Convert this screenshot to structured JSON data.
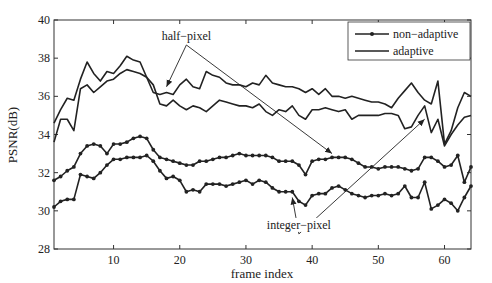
{
  "chart_data": {
    "type": "line",
    "title": "",
    "xlabel": "frame index",
    "ylabel": "PSNR(dB)",
    "xlim": [
      1,
      64
    ],
    "ylim": [
      28,
      40
    ],
    "xticks": [
      10,
      20,
      30,
      40,
      50,
      60
    ],
    "yticks": [
      28,
      30,
      32,
      34,
      36,
      38,
      40
    ],
    "grid": false,
    "legend": {
      "position": "upper right",
      "entries": [
        {
          "label": "non−adaptive",
          "style": "line-with-dots"
        },
        {
          "label": "adaptive",
          "style": "line"
        }
      ]
    },
    "annotations": [
      {
        "text": "half−pixel",
        "x": 21,
        "y": 38.9,
        "arrows_to": [
          [
            18,
            36.5
          ],
          [
            43,
            33.0
          ]
        ]
      },
      {
        "text": "integer−pixel",
        "x": 38,
        "y": 29.0,
        "arrows_to": [
          [
            37,
            30.7
          ],
          [
            57,
            34.8
          ]
        ]
      }
    ],
    "x": [
      1,
      2,
      3,
      4,
      5,
      6,
      7,
      8,
      9,
      10,
      11,
      12,
      13,
      14,
      15,
      16,
      17,
      18,
      19,
      20,
      21,
      22,
      23,
      24,
      25,
      26,
      27,
      28,
      29,
      30,
      31,
      32,
      33,
      34,
      35,
      36,
      37,
      38,
      39,
      40,
      41,
      42,
      43,
      44,
      45,
      46,
      47,
      48,
      49,
      50,
      51,
      52,
      53,
      54,
      55,
      56,
      57,
      58,
      59,
      60,
      61,
      62,
      63,
      64
    ],
    "series": [
      {
        "name": "half-pixel adaptive",
        "group": "adaptive",
        "values": [
          34.6,
          35.3,
          35.9,
          35.8,
          36.9,
          37.8,
          37.2,
          36.8,
          37.3,
          37.2,
          37.6,
          38.1,
          37.9,
          37.8,
          37.0,
          36.2,
          36.1,
          36.2,
          36.1,
          36.6,
          36.9,
          36.5,
          36.4,
          37.3,
          37.1,
          37.0,
          36.7,
          36.6,
          36.6,
          36.5,
          36.7,
          36.6,
          37.1,
          36.7,
          36.6,
          36.5,
          36.5,
          36.4,
          36.2,
          36.4,
          36.1,
          36.4,
          36.0,
          36.0,
          35.9,
          36.0,
          35.9,
          35.8,
          35.7,
          35.7,
          35.6,
          35.4,
          35.9,
          36.3,
          36.7,
          36.2,
          35.8,
          35.6,
          36.8,
          33.5,
          34.2,
          35.4,
          36.2,
          36.0
        ]
      },
      {
        "name": "integer-pixel adaptive",
        "group": "adaptive",
        "values": [
          33.6,
          34.8,
          34.8,
          34.2,
          36.4,
          36.6,
          36.2,
          36.5,
          36.8,
          36.9,
          37.2,
          37.4,
          37.3,
          37.2,
          37.0,
          36.6,
          35.6,
          35.5,
          35.8,
          35.5,
          35.3,
          35.5,
          35.4,
          35.2,
          35.5,
          35.8,
          35.7,
          35.6,
          35.5,
          35.5,
          35.4,
          35.6,
          35.2,
          35.0,
          35.3,
          35.2,
          35.5,
          35.0,
          34.8,
          35.3,
          35.3,
          35.4,
          35.3,
          35.2,
          35.3,
          34.8,
          35.0,
          35.0,
          35.0,
          35.0,
          35.1,
          35.1,
          35.0,
          34.3,
          34.4,
          35.0,
          35.5,
          34.1,
          34.8,
          33.4,
          34.0,
          34.5,
          34.9,
          35.0
        ]
      },
      {
        "name": "half-pixel non-adaptive",
        "group": "non-adaptive",
        "values": [
          31.6,
          31.8,
          32.1,
          32.3,
          33.0,
          33.4,
          33.5,
          33.4,
          33.0,
          33.5,
          33.5,
          33.6,
          33.8,
          33.9,
          33.8,
          33.2,
          32.8,
          32.7,
          32.6,
          32.5,
          32.4,
          32.4,
          32.6,
          32.6,
          32.7,
          32.8,
          32.8,
          32.9,
          33.0,
          32.9,
          32.9,
          32.9,
          32.9,
          32.8,
          32.6,
          32.6,
          32.6,
          32.4,
          31.9,
          32.6,
          32.7,
          32.7,
          32.8,
          32.8,
          32.8,
          32.7,
          32.5,
          32.3,
          32.3,
          32.2,
          32.3,
          32.3,
          32.3,
          32.2,
          32.1,
          32.2,
          32.8,
          32.8,
          32.6,
          32.3,
          32.4,
          32.9,
          31.5,
          32.3
        ]
      },
      {
        "name": "integer-pixel non-adaptive",
        "group": "non-adaptive",
        "values": [
          30.2,
          30.5,
          30.6,
          30.6,
          31.9,
          31.8,
          31.7,
          32.0,
          32.4,
          32.7,
          32.7,
          32.8,
          32.8,
          32.8,
          32.9,
          32.6,
          32.1,
          31.7,
          31.8,
          31.6,
          31.0,
          31.1,
          31.0,
          31.4,
          31.4,
          31.4,
          31.3,
          31.4,
          31.5,
          31.6,
          31.4,
          31.6,
          31.5,
          31.2,
          31.0,
          31.0,
          31.0,
          30.5,
          30.3,
          30.8,
          30.9,
          30.9,
          31.2,
          31.3,
          31.1,
          30.9,
          30.8,
          30.7,
          30.8,
          30.8,
          30.9,
          30.8,
          30.9,
          31.3,
          30.7,
          30.7,
          31.5,
          30.1,
          30.3,
          30.6,
          30.4,
          30.0,
          30.7,
          31.3
        ]
      }
    ]
  }
}
